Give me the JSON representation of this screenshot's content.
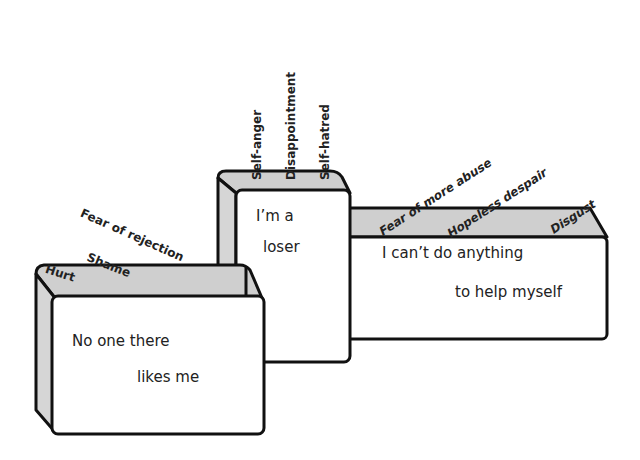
{
  "boxes": [
    {
      "id": "left",
      "line1": "No one there",
      "line2": "likes me",
      "emotions": [
        "Hurt",
        "Shame",
        "Fear of rejection"
      ]
    },
    {
      "id": "middle",
      "line1": "I’m  a",
      "line2": "loser",
      "emotions": [
        "Self-anger",
        "Disappointment",
        "Self-hatred"
      ]
    },
    {
      "id": "right",
      "line1": "I can’t do anything",
      "line2": "to help myself",
      "emotions": [
        "Fear of more abuse",
        "Hopeless despair",
        "Disgust"
      ]
    }
  ],
  "colors": {
    "top": "#c8c8c8",
    "side": "#d2d2d2",
    "face": "#ffffff",
    "stroke": "#111111"
  }
}
